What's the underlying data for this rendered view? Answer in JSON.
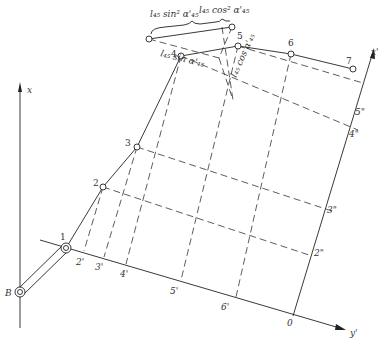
{
  "diagram": {
    "axes": {
      "x": "x",
      "x_prime": "x'",
      "y_prime": "y'"
    },
    "origin_label": "0",
    "base_point": "B",
    "points": [
      "1",
      "2",
      "3",
      "4",
      "5",
      "6",
      "7"
    ],
    "projections_prime": [
      "2'",
      "3'",
      "4'",
      "5'",
      "6'"
    ],
    "projections_double_prime": [
      "2\"",
      "3\"",
      "4\"",
      "5\""
    ],
    "formulas": {
      "sin_sq": "l₄₅ sin² α'₄₅",
      "cos_sq": "l₄₅ cos² α'₄₅",
      "sin": "l₄₅ sin α'₄₅",
      "cos": "l₄₅ cos α'₄₅"
    }
  }
}
